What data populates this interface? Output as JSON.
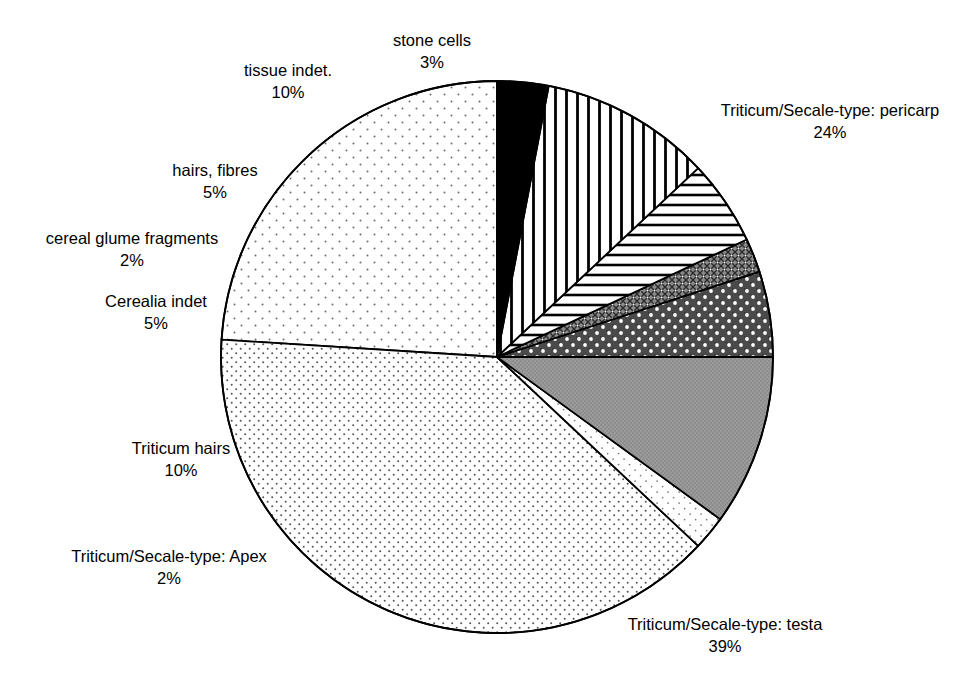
{
  "chart_data": {
    "type": "pie",
    "title": "",
    "subtitle": "",
    "xlabel": "",
    "ylabel": "",
    "legend_position": "none",
    "grid": false,
    "units": "%",
    "total": 100,
    "start_angle_deg": 0,
    "direction": "counterclockwise",
    "categories": [
      "Triticum/Secale-type: pericarp",
      "Triticum/Secale-type: testa",
      "Triticum/Secale-type: Apex",
      "Triticum hairs",
      "Cerealia indet",
      "cereal glume fragments",
      "hairs, fibres",
      "tissue indet.",
      "stone cells"
    ],
    "values": [
      24,
      39,
      2,
      10,
      5,
      2,
      5,
      10,
      3
    ],
    "slices": [
      {
        "label": "Triticum/Secale-type: pericarp",
        "percent_text": "24%",
        "value": 24,
        "fill": "sparse-dots",
        "color": "#ffffff"
      },
      {
        "label": "Triticum/Secale-type: testa",
        "percent_text": "39%",
        "value": 39,
        "fill": "dense-dots",
        "color": "#ffffff"
      },
      {
        "label": "Triticum/Secale-type: Apex",
        "percent_text": "2%",
        "value": 2,
        "fill": "light-dots",
        "color": "#ffffff"
      },
      {
        "label": "Triticum hairs",
        "percent_text": "10%",
        "value": 10,
        "fill": "solid-grey",
        "color": "#9a9a9a"
      },
      {
        "label": "Cerealia indet",
        "percent_text": "5%",
        "value": 5,
        "fill": "dark-white-dots",
        "color": "#4a4a4a"
      },
      {
        "label": "cereal glume fragments",
        "percent_text": "2%",
        "value": 2,
        "fill": "cross-hatch",
        "color": "#6e6e6e"
      },
      {
        "label": "hairs, fibres",
        "percent_text": "5%",
        "value": 5,
        "fill": "horizontal-lines",
        "color": "#000000"
      },
      {
        "label": "tissue indet.",
        "percent_text": "10%",
        "value": 10,
        "fill": "vertical-lines",
        "color": "#000000"
      },
      {
        "label": "stone cells",
        "percent_text": "3%",
        "value": 3,
        "fill": "solid-black",
        "color": "#000000"
      }
    ]
  },
  "labels": {
    "stone_cells": {
      "name": "stone cells",
      "pct": "3%"
    },
    "tissue_indet": {
      "name": "tissue indet.",
      "pct": "10%"
    },
    "hairs_fibres": {
      "name": "hairs, fibres",
      "pct": "5%"
    },
    "cereal_glume_fragments": {
      "name": "cereal glume fragments",
      "pct": "2%"
    },
    "cerealia_indet": {
      "name": "Cerealia indet",
      "pct": "5%"
    },
    "triticum_hairs": {
      "name": "Triticum hairs",
      "pct": "10%"
    },
    "apex": {
      "name": "Triticum/Secale-type: Apex",
      "pct": "2%"
    },
    "testa": {
      "name": "Triticum/Secale-type: testa",
      "pct": "39%"
    },
    "pericarp": {
      "name": "Triticum/Secale-type: pericarp",
      "pct": "24%"
    }
  },
  "geometry": {
    "center_x": 497,
    "center_y": 357,
    "radius": 276,
    "stroke": "#000000",
    "stroke_width": 1.8
  }
}
